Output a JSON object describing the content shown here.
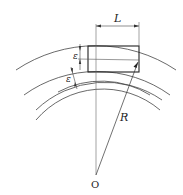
{
  "diagram": {
    "labels": {
      "length": "L",
      "radius": "R",
      "center": "O",
      "gap_upper": "ε",
      "gap_lower": "ε"
    },
    "colors": {
      "stroke": "#333333",
      "thin": "#555555",
      "background": "#ffffff"
    }
  }
}
